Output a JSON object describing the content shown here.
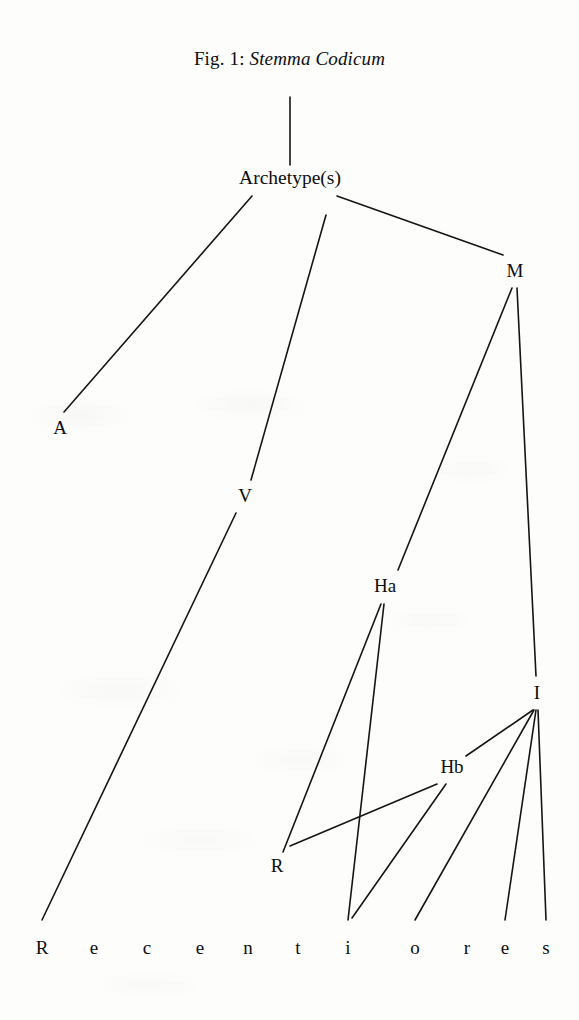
{
  "figure": {
    "title_prefix": "Fig. 1:",
    "title_italic": "Stemma Codicum",
    "title_full": "Fig. 1: Stemma Codicum",
    "ink_color": "#0d0d0d",
    "paper_color": "#fdfdfc"
  },
  "nodes": {
    "archetype": "Archetype(s)",
    "a": "A",
    "v": "V",
    "m": "M",
    "ha": "Ha",
    "hb": "Hb",
    "i": "I",
    "r": "R"
  },
  "recentiores": {
    "word": "Recentiores",
    "letters": [
      "R",
      "e",
      "c",
      "e",
      "n",
      "t",
      "i",
      "o",
      "r",
      "e",
      "s"
    ],
    "letter_x": [
      42,
      94,
      147,
      200,
      248,
      298,
      348,
      415,
      467,
      505,
      546
    ],
    "baseline_y": 952
  },
  "chart_data": {
    "type": "diagram",
    "diagram_kind": "stemma codicum (manuscript family tree)",
    "title": "Fig. 1: Stemma Codicum",
    "node_positions": {
      "archetype": [
        290,
        182
      ],
      "A": [
        60,
        430
      ],
      "V": [
        245,
        497
      ],
      "M": [
        515,
        272
      ],
      "Ha": [
        385,
        588
      ],
      "Hb": [
        452,
        768
      ],
      "I": [
        537,
        694
      ],
      "R": [
        277,
        868
      ],
      "rec_R": [
        42,
        920
      ],
      "rec_n": [
        248,
        920
      ],
      "rec_i": [
        348,
        920
      ],
      "rec_o": [
        415,
        920
      ],
      "rec_e": [
        505,
        920
      ],
      "rec_s": [
        546,
        920
      ]
    },
    "edges": [
      {
        "from": "title",
        "to": "archetype"
      },
      {
        "from": "archetype",
        "to": "A"
      },
      {
        "from": "archetype",
        "to": "V"
      },
      {
        "from": "archetype",
        "to": "M"
      },
      {
        "from": "M",
        "to": "Ha"
      },
      {
        "from": "M",
        "to": "I"
      },
      {
        "from": "V",
        "to": "rec_R"
      },
      {
        "from": "Ha",
        "to": "R"
      },
      {
        "from": "Ha",
        "to": "rec_i"
      },
      {
        "from": "Hb",
        "to": "R"
      },
      {
        "from": "Hb",
        "to": "rec_i"
      },
      {
        "from": "I",
        "to": "Hb"
      },
      {
        "from": "I",
        "to": "rec_o"
      },
      {
        "from": "I",
        "to": "rec_e"
      },
      {
        "from": "I",
        "to": "rec_s"
      },
      {
        "from": "R",
        "to": "rec_n"
      }
    ],
    "leaf_row_label": "Recentiores"
  },
  "geometry": {
    "title_y": 62,
    "lines": [
      {
        "name": "title-to-archetype",
        "x1": 290,
        "y1": 97,
        "x2": 290,
        "y2": 165
      },
      {
        "name": "archetype-to-A",
        "x1": 252,
        "y1": 196,
        "x2": 64,
        "y2": 412
      },
      {
        "name": "archetype-to-V",
        "x1": 326,
        "y1": 215,
        "x2": 251,
        "y2": 480
      },
      {
        "name": "archetype-to-M",
        "x1": 337,
        "y1": 196,
        "x2": 503,
        "y2": 255
      },
      {
        "name": "M-to-Ha",
        "x1": 512,
        "y1": 288,
        "x2": 398,
        "y2": 570
      },
      {
        "name": "M-to-I",
        "x1": 517,
        "y1": 288,
        "x2": 536,
        "y2": 676
      },
      {
        "name": "V-to-recR",
        "x1": 236,
        "y1": 513,
        "x2": 42,
        "y2": 920
      },
      {
        "name": "Ha-to-R",
        "x1": 381,
        "y1": 604,
        "x2": 283,
        "y2": 852
      },
      {
        "name": "Ha-to-reci",
        "x1": 384,
        "y1": 604,
        "x2": 348,
        "y2": 920
      },
      {
        "name": "Hb-to-R",
        "x1": 437,
        "y1": 784,
        "x2": 290,
        "y2": 846
      },
      {
        "name": "Hb-to-reci",
        "x1": 446,
        "y1": 784,
        "x2": 352,
        "y2": 918
      },
      {
        "name": "I-to-Hb",
        "x1": 533,
        "y1": 710,
        "x2": 466,
        "y2": 756
      },
      {
        "name": "I-to-reco",
        "x1": 534,
        "y1": 710,
        "x2": 415,
        "y2": 920
      },
      {
        "name": "I-to-rece",
        "x1": 536,
        "y1": 710,
        "x2": 505,
        "y2": 920
      },
      {
        "name": "I-to-recs",
        "x1": 538,
        "y1": 710,
        "x2": 546,
        "y2": 920
      }
    ]
  }
}
